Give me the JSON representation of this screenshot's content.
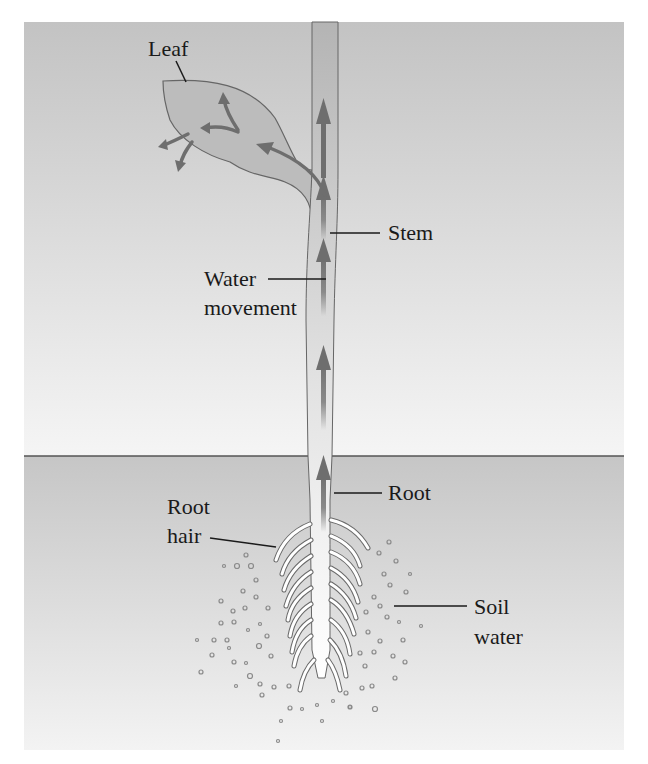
{
  "diagram": {
    "labels": {
      "leaf": "Leaf",
      "stem": "Stem",
      "water_movement_line1": "Water",
      "water_movement_line2": "movement",
      "root": "Root",
      "root_hair_line1": "Root",
      "root_hair_line2": "hair",
      "soil_water_line1": "Soil",
      "soil_water_line2": "water"
    },
    "regions": {
      "air": "above-ground (air)",
      "soil": "below-ground (soil)"
    },
    "colors": {
      "air_top": "#c4c4c4",
      "air_bottom": "#f4f4f4",
      "soil_top": "#c8c8c8",
      "soil_bottom": "#f2f2f2",
      "plant_fill": "#bdbdbd",
      "arrow": "#7a7a7a",
      "outline": "#5a5a5a",
      "text": "#1a1a1a"
    }
  }
}
